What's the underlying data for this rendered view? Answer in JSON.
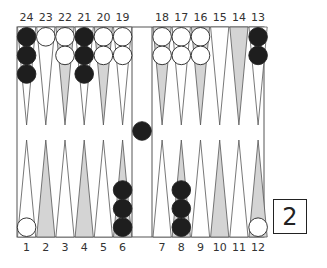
{
  "board": {
    "top_labels": [
      "24",
      "23",
      "22",
      "21",
      "20",
      "19",
      "18",
      "17",
      "16",
      "15",
      "14",
      "13"
    ],
    "bottom_labels": [
      "1",
      "2",
      "3",
      "4",
      "5",
      "6",
      "7",
      "8",
      "9",
      "10",
      "11",
      "12"
    ],
    "colors": {
      "black": "#1e1e1e",
      "white": "#ffffff",
      "shaded_point": "#d4d4d4",
      "line": "#555555"
    },
    "points": {
      "24": {
        "color": "black",
        "count": 3
      },
      "23": {
        "color": "white",
        "count": 1
      },
      "22": {
        "color": "white",
        "count": 2
      },
      "21": {
        "color": "black",
        "count": 3
      },
      "20": {
        "color": "white",
        "count": 2
      },
      "19": {
        "color": "white",
        "count": 2
      },
      "18": {
        "color": "white",
        "count": 2
      },
      "17": {
        "color": "white",
        "count": 2
      },
      "16": {
        "color": "white",
        "count": 2
      },
      "13": {
        "color": "black",
        "count": 2
      },
      "1": {
        "color": "white",
        "count": 1
      },
      "6": {
        "color": "black",
        "count": 3
      },
      "8": {
        "color": "black",
        "count": 3
      },
      "12": {
        "color": "white",
        "count": 1
      }
    },
    "bar": {
      "black": 1
    }
  },
  "die": {
    "value": "2"
  }
}
